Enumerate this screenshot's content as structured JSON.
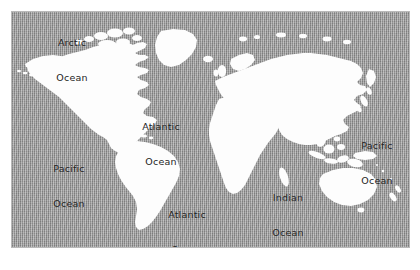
{
  "map": {
    "title": "World Map",
    "plate": {
      "left": 11,
      "top": 11,
      "width": 399,
      "height": 237
    },
    "colors": {
      "ocean": "#9a9a9a",
      "land": "#fdfdfd",
      "label_text": "#1d1d1d",
      "page_background": "#ffffff",
      "plate_border": "#b9b9b9"
    },
    "ocean_labels": [
      {
        "name": "arctic-ocean-label",
        "line1": "Arctic",
        "line2": "Ocean",
        "x": 44,
        "y": 14
      },
      {
        "name": "atlantic-ocean-north-label",
        "line1": "Atlantic",
        "line2": "Ocean",
        "x": 134,
        "y": 98
      },
      {
        "name": "pacific-ocean-west-label",
        "line1": "Pacific",
        "line2": "Ocean",
        "x": 42,
        "y": 140
      },
      {
        "name": "atlantic-ocean-south-label",
        "line1": "Atlantic",
        "line2": "Ocean",
        "x": 160,
        "y": 186
      },
      {
        "name": "indian-ocean-label",
        "line1": "Indian",
        "line2": "Ocean",
        "x": 264,
        "y": 169
      },
      {
        "name": "pacific-ocean-east-label",
        "line1": "Pacific",
        "line2": "Ocean",
        "x": 352,
        "y": 117
      }
    ],
    "landmasses": [
      "north-america",
      "greenland",
      "south-america",
      "africa",
      "europe",
      "asia",
      "australia",
      "new-zealand",
      "indonesia",
      "japan",
      "british-isles",
      "madagascar",
      "iceland",
      "arctic-islands"
    ]
  }
}
